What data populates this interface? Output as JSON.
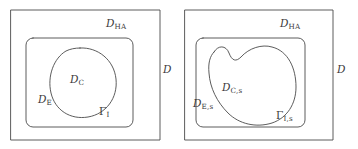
{
  "figure": {
    "type": "geometry-diagram",
    "width": 358,
    "height": 149,
    "background_color": "#ffffff",
    "line_color": "#4a4a4a",
    "text_color": "#3a3a3a"
  },
  "panels": [
    {
      "id": "left",
      "name": "reference-configuration",
      "outer_rect": {
        "x": 11,
        "y": 10,
        "w": 149,
        "h": 130
      },
      "inner_rect": {
        "x": 26,
        "y": 38,
        "w": 107,
        "h": 89,
        "radius": 7
      },
      "blob": {
        "shape": "oval",
        "cx": 83,
        "cy": 83,
        "rx": 33,
        "ry": 35
      },
      "labels": [
        {
          "name": "label-d-outer",
          "base": "D",
          "sub": "",
          "x": 163,
          "y": 70
        },
        {
          "name": "label-d-ha",
          "base": "D",
          "sub": "HA",
          "x": 106,
          "y": 24
        },
        {
          "name": "label-d-c",
          "base": "D",
          "sub": "C",
          "x": 70,
          "y": 80
        },
        {
          "name": "label-d-e",
          "base": "D",
          "sub": "E",
          "x": 38,
          "y": 100
        },
        {
          "name": "label-gamma-i",
          "base": "Γ",
          "sub": "I",
          "x": 99,
          "y": 112
        }
      ]
    },
    {
      "id": "right",
      "name": "deformed-configuration",
      "outer_rect": {
        "x": 185,
        "y": 10,
        "w": 148,
        "h": 130
      },
      "inner_rect": {
        "x": 196,
        "y": 38,
        "w": 109,
        "h": 89,
        "radius": 7
      },
      "blob": {
        "shape": "kidney",
        "note": "concave notch at top center"
      },
      "labels": [
        {
          "name": "label-d-outer-s",
          "base": "D",
          "sub": "",
          "x": 337,
          "y": 70
        },
        {
          "name": "label-d-ha-s",
          "base": "D",
          "sub": "HA",
          "x": 280,
          "y": 24
        },
        {
          "name": "label-d-c-s",
          "base": "D",
          "sub": "C,s",
          "x": 222,
          "y": 88
        },
        {
          "name": "label-d-e-s",
          "base": "D",
          "sub": "E,s",
          "x": 196,
          "y": 104
        },
        {
          "name": "label-gamma-i-s",
          "base": "Γ",
          "sub": "I,s",
          "x": 276,
          "y": 116
        }
      ]
    }
  ]
}
